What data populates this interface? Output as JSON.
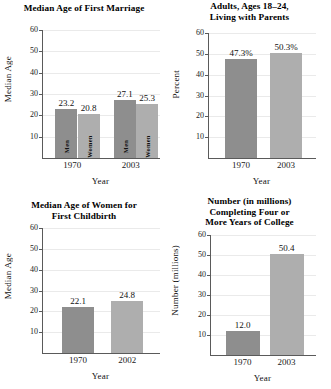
{
  "figure": {
    "panel_count": 4,
    "background": "#ffffff",
    "bar_colors": {
      "dark": "#8e8e8e",
      "light": "#aeaeae"
    },
    "axis_color": "#5a5a5a",
    "gridline_color": "#eaeaea"
  },
  "chart_data": [
    {
      "type": "bar",
      "title": "Median Age of First Marriage",
      "title_lines": [
        "Median Age of First Marriage"
      ],
      "xlabel": "Year",
      "ylabel": "Median Age",
      "ylim": [
        0,
        60
      ],
      "yticks": [
        10,
        20,
        30,
        40,
        50,
        60
      ],
      "ytick_labels": [
        "10",
        "20",
        "30",
        "40",
        "50",
        "60"
      ],
      "grid": true,
      "legend": "none",
      "categories": [
        "1970",
        "2003"
      ],
      "groups": [
        "Men",
        "Women"
      ],
      "bars": [
        {
          "group": "1970",
          "series": "Men",
          "value": 23.2,
          "label": "23.2",
          "inner_label": "Men",
          "color": "dark"
        },
        {
          "group": "1970",
          "series": "Women",
          "value": 20.8,
          "label": "20.8",
          "inner_label": "Women",
          "color": "light"
        },
        {
          "group": "2003",
          "series": "Men",
          "value": 27.1,
          "label": "27.1",
          "inner_label": "Men",
          "color": "dark"
        },
        {
          "group": "2003",
          "series": "Women",
          "value": 25.3,
          "label": "25.3",
          "inner_label": "Women",
          "color": "light"
        }
      ]
    },
    {
      "type": "bar",
      "title": "Adults, Ages 18–24, Living with Parents",
      "title_lines": [
        "Adults, Ages 18–24,",
        "Living with Parents"
      ],
      "xlabel": "Year",
      "ylabel": "Percent",
      "ylim": [
        0,
        60
      ],
      "yticks": [
        10,
        20,
        30,
        40,
        50,
        60
      ],
      "ytick_labels": [
        "10",
        "20",
        "30",
        "40",
        "50",
        "60"
      ],
      "grid": true,
      "legend": "none",
      "categories": [
        "1970",
        "2003"
      ],
      "bars": [
        {
          "group": "1970",
          "value": 47.3,
          "label": "47.3%",
          "color": "dark"
        },
        {
          "group": "2003",
          "value": 50.3,
          "label": "50.3%",
          "color": "light"
        }
      ]
    },
    {
      "type": "bar",
      "title": "Median Age of Women for First Childbirth",
      "title_lines": [
        "Median Age of Women for",
        "First Childbirth"
      ],
      "xlabel": "Year",
      "ylabel": "Median Age",
      "ylim": [
        0,
        60
      ],
      "yticks": [
        10,
        20,
        30,
        40,
        50,
        60
      ],
      "ytick_labels": [
        "10",
        "20",
        "30",
        "40",
        "50",
        "60"
      ],
      "grid": true,
      "legend": "none",
      "categories": [
        "1970",
        "2002"
      ],
      "bars": [
        {
          "group": "1970",
          "value": 22.1,
          "label": "22.1",
          "color": "dark"
        },
        {
          "group": "2002",
          "value": 24.8,
          "label": "24.8",
          "color": "light"
        }
      ]
    },
    {
      "type": "bar",
      "title": "Number (in millions) Completing Four or More Years of College",
      "title_lines": [
        "Number (in millions)",
        "Completing Four or",
        "More Years of College"
      ],
      "xlabel": "Year",
      "ylabel": "Number (millions)",
      "ylim": [
        0,
        60
      ],
      "yticks": [
        10,
        20,
        30,
        40,
        50,
        60
      ],
      "ytick_labels": [
        "10",
        "20",
        "30",
        "40",
        "50",
        "60"
      ],
      "grid": true,
      "legend": "none",
      "categories": [
        "1970",
        "2003"
      ],
      "bars": [
        {
          "group": "1970",
          "value": 12.0,
          "label": "12.0",
          "color": "dark"
        },
        {
          "group": "2003",
          "value": 50.4,
          "label": "50.4",
          "color": "light"
        }
      ]
    }
  ]
}
